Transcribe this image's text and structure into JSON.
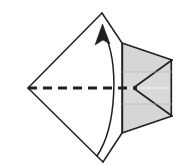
{
  "figure": {
    "width": 193,
    "height": 166,
    "background_color": "#ffffff",
    "stroke_color": "#231f20",
    "shade_fill": "#d6d6d6",
    "shade_fill_light": "#dcdcdc",
    "fold_line_color": "#231f20"
  },
  "shapes": {
    "kite": {
      "name": "kite-outline",
      "points": "28,88 102,13 172,60 172,116 103,162",
      "fill": "#ffffff",
      "stroke": "#231f20",
      "stroke_width": 1.6
    },
    "kite_left_upper_edge": {
      "name": "kite-edge-upper-left",
      "from": [
        28,
        88
      ],
      "to": [
        102,
        13
      ]
    },
    "kite_left_lower_edge": {
      "name": "kite-edge-lower-left",
      "from": [
        28,
        88
      ],
      "to": [
        103,
        162
      ]
    },
    "flap_upper": {
      "name": "upper-shaded-flap",
      "points": "122,43 172,60 172,88 134,88 122,88",
      "fill": "#d6d6d6",
      "stroke": "#231f20",
      "stroke_width": 1.8
    },
    "flap_lower": {
      "name": "lower-shaded-flap",
      "points": "122,133 172,116 172,89 134,89 122,89",
      "fill": "#d6d6d6",
      "stroke": "#231f20",
      "stroke_width": 1.8
    },
    "flap_upper_fold": {
      "name": "upper-flap-fold-crease",
      "from": [
        134,
        88
      ],
      "to": [
        172,
        60
      ]
    },
    "flap_lower_fold": {
      "name": "lower-flap-fold-crease",
      "from": [
        134,
        89
      ],
      "to": [
        172,
        116
      ]
    },
    "flap_right_edge": {
      "name": "flap-right-vertical-edge",
      "from": [
        172,
        60
      ],
      "to": [
        172,
        116
      ]
    },
    "flap_upper_left_edge": {
      "name": "upper-flap-left-vertical-edge",
      "from": [
        122,
        43
      ],
      "to": [
        122,
        88
      ]
    },
    "flap_lower_left_edge": {
      "name": "lower-flap-left-vertical-edge",
      "from": [
        122,
        89
      ],
      "to": [
        122,
        133
      ]
    },
    "kite_top_to_flap": {
      "name": "kite-edge-to-upper-flap",
      "from": [
        102,
        13
      ],
      "to": [
        122,
        43
      ]
    },
    "kite_bottom_to_flap": {
      "name": "kite-edge-to-lower-flap",
      "from": [
        103,
        162
      ],
      "to": [
        122,
        133
      ]
    }
  },
  "fold_line": {
    "name": "horizontal-fold-dashed-line",
    "from": [
      28,
      88
    ],
    "to": [
      136,
      88
    ],
    "dash_pattern": "9 6",
    "stroke_width": 2.6,
    "color": "#231f20"
  },
  "arrow": {
    "name": "fold-direction-arrow",
    "type": "curved",
    "path": "M 97,156 C 116,124 118,60 103,31",
    "head_tip": [
      101,
      25
    ],
    "head_angle_deg": -18,
    "stroke_width": 1.5,
    "color": "#231f20",
    "label": ""
  },
  "labels": {
    "caption": "",
    "annotations": []
  }
}
